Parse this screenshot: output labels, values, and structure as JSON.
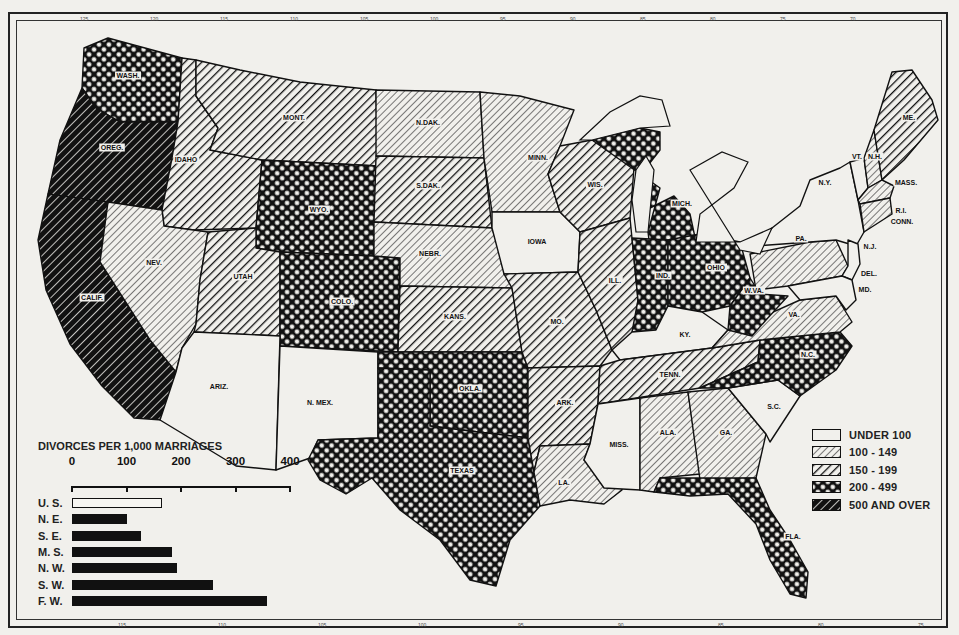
{
  "map": {
    "subject": "Divorces per 1,000 marriages by state",
    "longitude_ticks_top": [
      "125",
      "120",
      "115",
      "110",
      "105",
      "100",
      "95",
      "90",
      "85",
      "80",
      "75",
      "70"
    ],
    "longitude_ticks_bottom": [
      "115",
      "110",
      "105",
      "100",
      "95",
      "90",
      "85",
      "80",
      "75"
    ],
    "states": [
      {
        "abbr": "WASH.",
        "category": "200-499",
        "x": 128,
        "y": 78
      },
      {
        "abbr": "OREG.",
        "category": "500+",
        "x": 112,
        "y": 150
      },
      {
        "abbr": "CALIF.",
        "category": "500+",
        "x": 92,
        "y": 300
      },
      {
        "abbr": "IDAHO",
        "category": "150-199",
        "x": 186,
        "y": 162
      },
      {
        "abbr": "NEV.",
        "category": "100-149",
        "x": 154,
        "y": 265
      },
      {
        "abbr": "MONT.",
        "category": "150-199",
        "x": 294,
        "y": 120
      },
      {
        "abbr": "WYO.",
        "category": "200-499",
        "x": 319,
        "y": 212
      },
      {
        "abbr": "UTAH",
        "category": "150-199",
        "x": 243,
        "y": 279
      },
      {
        "abbr": "COLO.",
        "category": "200-499",
        "x": 342,
        "y": 304
      },
      {
        "abbr": "ARIZ.",
        "category": "Under 100",
        "x": 219,
        "y": 389
      },
      {
        "abbr": "N. MEX.",
        "category": "Under 100",
        "x": 320,
        "y": 405
      },
      {
        "abbr": "N.DAK.",
        "category": "100-149",
        "x": 428,
        "y": 125
      },
      {
        "abbr": "S.DAK.",
        "category": "150-199",
        "x": 428,
        "y": 188
      },
      {
        "abbr": "NEBR.",
        "category": "100-149",
        "x": 430,
        "y": 256
      },
      {
        "abbr": "KANS.",
        "category": "150-199",
        "x": 455,
        "y": 319
      },
      {
        "abbr": "OKLA.",
        "category": "200-499",
        "x": 470,
        "y": 391
      },
      {
        "abbr": "TEXAS",
        "category": "200-499",
        "x": 462,
        "y": 473
      },
      {
        "abbr": "MINN.",
        "category": "100-149",
        "x": 538,
        "y": 160
      },
      {
        "abbr": "IOWA",
        "category": "Under 100",
        "x": 537,
        "y": 244
      },
      {
        "abbr": "MO.",
        "category": "150-199",
        "x": 557,
        "y": 324
      },
      {
        "abbr": "ARK.",
        "category": "150-199",
        "x": 565,
        "y": 405
      },
      {
        "abbr": "LA.",
        "category": "100-149",
        "x": 564,
        "y": 485
      },
      {
        "abbr": "WIS.",
        "category": "150-199",
        "x": 595,
        "y": 187
      },
      {
        "abbr": "ILL.",
        "category": "150-199",
        "x": 615,
        "y": 283
      },
      {
        "abbr": "MICH.",
        "category": "200-499",
        "x": 682,
        "y": 206
      },
      {
        "abbr": "IND.",
        "category": "200-499",
        "x": 663,
        "y": 278
      },
      {
        "abbr": "OHIO",
        "category": "200-499",
        "x": 716,
        "y": 270
      },
      {
        "abbr": "KY.",
        "category": "Under 100",
        "x": 685,
        "y": 337
      },
      {
        "abbr": "TENN.",
        "category": "150-199",
        "x": 670,
        "y": 377
      },
      {
        "abbr": "MISS.",
        "category": "Under 100",
        "x": 619,
        "y": 447
      },
      {
        "abbr": "ALA.",
        "category": "100-149",
        "x": 668,
        "y": 435
      },
      {
        "abbr": "GA.",
        "category": "100-149",
        "x": 726,
        "y": 435
      },
      {
        "abbr": "FLA.",
        "category": "200-499",
        "x": 793,
        "y": 539
      },
      {
        "abbr": "S.C.",
        "category": "Under 100",
        "x": 774,
        "y": 409
      },
      {
        "abbr": "N.C.",
        "category": "200-499",
        "x": 808,
        "y": 357
      },
      {
        "abbr": "VA.",
        "category": "100-149",
        "x": 794,
        "y": 317
      },
      {
        "abbr": "W.VA.",
        "category": "200-499",
        "x": 754,
        "y": 293
      },
      {
        "abbr": "PA.",
        "category": "100-149",
        "x": 801,
        "y": 241
      },
      {
        "abbr": "N.Y.",
        "category": "Under 100",
        "x": 825,
        "y": 185
      },
      {
        "abbr": "N.J.",
        "category": "Under 100",
        "x": 870,
        "y": 249
      },
      {
        "abbr": "DEL.",
        "category": "Under 100",
        "x": 869,
        "y": 276
      },
      {
        "abbr": "MD.",
        "category": "Under 100",
        "x": 865,
        "y": 292
      },
      {
        "abbr": "VT.",
        "category": "Under 100",
        "x": 857,
        "y": 159
      },
      {
        "abbr": "N.H.",
        "category": "100-149",
        "x": 875,
        "y": 159
      },
      {
        "abbr": "ME.",
        "category": "150-199",
        "x": 909,
        "y": 120
      },
      {
        "abbr": "MASS.",
        "category": "100-149",
        "x": 906,
        "y": 185
      },
      {
        "abbr": "R.I.",
        "category": "100-149",
        "x": 901,
        "y": 213
      },
      {
        "abbr": "CONN.",
        "category": "100-149",
        "x": 902,
        "y": 224
      }
    ]
  },
  "legend": {
    "items": [
      {
        "label": "UNDER 100",
        "pattern": "none"
      },
      {
        "label": "100 - 149",
        "pattern": "light-hatch"
      },
      {
        "label": "150 - 199",
        "pattern": "medium-hatch"
      },
      {
        "label": "200 - 499",
        "pattern": "crosshatch"
      },
      {
        "label": "500 AND OVER",
        "pattern": "dense-hatch"
      }
    ]
  },
  "chart_data": {
    "type": "bar",
    "orientation": "horizontal",
    "title": "DIVORCES PER 1,000 MARRIAGES",
    "xlabel": "",
    "ylabel": "",
    "xlim": [
      0,
      400
    ],
    "x_ticks": [
      "0",
      "100",
      "200",
      "300",
      "400"
    ],
    "categories": [
      "U. S.",
      "N. E.",
      "S. E.",
      "M. S.",
      "N. W.",
      "S. W.",
      "F. W."
    ],
    "values": [
      165,
      100,
      126,
      183,
      193,
      258,
      358
    ],
    "bar_styles": [
      "outline",
      "solid",
      "solid",
      "solid",
      "solid",
      "solid",
      "solid"
    ],
    "grid": false,
    "legend": "none"
  },
  "colors": {
    "ink": "#111111",
    "paper": "#f1f0ec"
  }
}
